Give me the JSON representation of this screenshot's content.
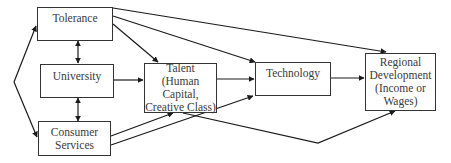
{
  "diagram": {
    "type": "flowchart",
    "nodes": {
      "tolerance": {
        "label": "Tolerance"
      },
      "university": {
        "label": "University"
      },
      "consumer_services": {
        "label": "Consumer\nServices"
      },
      "talent": {
        "label": "Talent\n(Human Capital,\nCreative Class)"
      },
      "technology": {
        "label": "Technology"
      },
      "regional_development": {
        "label": "Regional\nDevelopment\n(Income or\nWages)"
      }
    },
    "edges": [
      {
        "from": "left-bracket",
        "to": "Tolerance",
        "style": "arrow"
      },
      {
        "from": "left-bracket",
        "to": "Consumer Services",
        "style": "arrow"
      },
      {
        "from": "Tolerance",
        "to": "University",
        "style": "double-arrow"
      },
      {
        "from": "University",
        "to": "Consumer Services",
        "style": "double-arrow"
      },
      {
        "from": "Tolerance",
        "to": "Talent",
        "style": "arrow"
      },
      {
        "from": "Tolerance",
        "to": "Technology",
        "style": "arrow"
      },
      {
        "from": "Tolerance",
        "to": "Regional Development",
        "style": "arrow"
      },
      {
        "from": "University",
        "to": "Talent",
        "style": "arrow"
      },
      {
        "from": "Talent",
        "to": "Technology",
        "style": "arrow"
      },
      {
        "from": "Technology",
        "to": "Regional Development",
        "style": "arrow"
      },
      {
        "from": "Consumer Services",
        "to": "Talent",
        "style": "arrow"
      },
      {
        "from": "Consumer Services",
        "to": "Technology",
        "style": "arrow"
      },
      {
        "from": "Talent",
        "to": "Regional Development",
        "style": "arrow"
      }
    ],
    "colors": {
      "line": "#1a1a1a",
      "box_border": "#333333",
      "text": "#3a3a3a",
      "background": "#ffffff"
    }
  }
}
